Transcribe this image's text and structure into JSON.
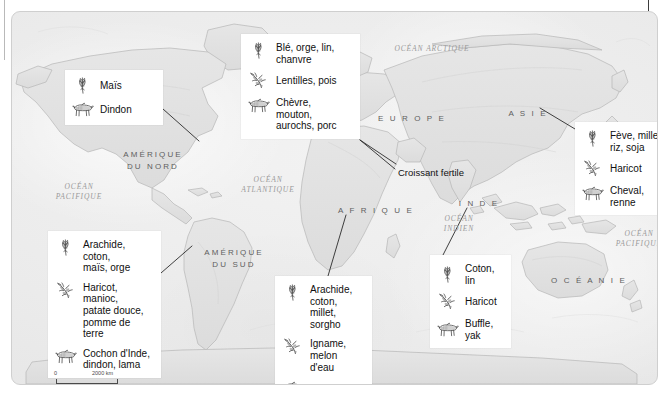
{
  "map": {
    "title_visible": false,
    "scale": {
      "zero_label": "0",
      "max_label": "2000 km"
    },
    "continent_labels": [
      {
        "name": "amerique-du-nord",
        "text": "AMÉRIQUE\nDU NORD",
        "x": 95,
        "y": 137,
        "w": 92
      },
      {
        "name": "amerique-du-sud",
        "text": "AMÉRIQUE\nDU SUD",
        "x": 178,
        "y": 235,
        "w": 88
      },
      {
        "name": "europe",
        "text": "E U R O P E",
        "x": 357,
        "y": 101,
        "w": 86
      },
      {
        "name": "afrique",
        "text": "A F R I Q U E",
        "x": 318,
        "y": 193,
        "w": 92
      },
      {
        "name": "asie",
        "text": "A S I E",
        "x": 488,
        "y": 96,
        "w": 56
      },
      {
        "name": "inde",
        "text": "I N D E",
        "x": 443,
        "y": 186,
        "w": 48
      },
      {
        "name": "oceanie",
        "text": "O C É A N I E",
        "x": 531,
        "y": 263,
        "w": 92
      }
    ],
    "ocean_labels": [
      {
        "name": "ocean-arctique",
        "text": "OCÉAN ARCTIQUE",
        "x": 374,
        "y": 32,
        "w": 92
      },
      {
        "name": "ocean-pacifique-ouest",
        "text": "OCÉAN\nPACIFIQUE",
        "x": 36,
        "y": 170,
        "w": 62
      },
      {
        "name": "ocean-atlantique",
        "text": "OCÉAN\nATLANTIQUE",
        "x": 222,
        "y": 163,
        "w": 68
      },
      {
        "name": "ocean-indien",
        "text": "OCÉAN\nINDIEN",
        "x": 418,
        "y": 202,
        "w": 58
      },
      {
        "name": "ocean-pacifique-est",
        "text": "OCÉAN\nPACIFIQUE",
        "x": 596,
        "y": 217,
        "w": 62
      }
    ],
    "point_labels": [
      {
        "name": "croissant-fertile",
        "text": "Croissant fertile",
        "x": 386,
        "y": 155
      }
    ],
    "callouts": [
      {
        "name": "callout-amerique-du-nord",
        "x": 53,
        "y": 58,
        "w": 98,
        "anchor_x": 151,
        "anchor_y": 97,
        "target_x": 187,
        "target_y": 129,
        "rows": [
          {
            "icon": "grain-icon",
            "text": "Maïs",
            "single": true
          },
          {
            "icon": "animal-icon",
            "text": "Dindon",
            "single": true
          }
        ]
      },
      {
        "name": "callout-croissant-fertile",
        "x": 229,
        "y": 22,
        "w": 119,
        "anchor_x": 348,
        "anchor_y": 128,
        "target_x": 383,
        "target_y": 157,
        "rows": [
          {
            "icon": "grain-icon",
            "text": "Blé, orge, lin,\nchanvre",
            "single": false
          },
          {
            "icon": "legume-icon",
            "text": "Lentilles, pois",
            "single": true
          },
          {
            "icon": "animal-icon",
            "text": "Chèvre,\nmouton,\naurochs, porc",
            "single": false
          }
        ]
      },
      {
        "name": "callout-asie",
        "x": 563,
        "y": 110,
        "w": 100,
        "anchor_x": 563,
        "anchor_y": 117,
        "target_x": 528,
        "target_y": 96,
        "rows": [
          {
            "icon": "grain-icon",
            "text": "Fève, millet,\nriz, soja",
            "single": false
          },
          {
            "icon": "legume-icon",
            "text": "Haricot",
            "single": true
          },
          {
            "icon": "animal-icon",
            "text": "Cheval,\nrenne",
            "single": false
          }
        ]
      },
      {
        "name": "callout-amerique-du-sud",
        "x": 36,
        "y": 219,
        "w": 113,
        "anchor_x": 149,
        "anchor_y": 261,
        "target_x": 180,
        "target_y": 234,
        "rows": [
          {
            "icon": "grain-icon",
            "text": "Arachide, coton,\nmaïs, orge",
            "single": false
          },
          {
            "icon": "legume-icon",
            "text": "Haricot, manioc,\npatate douce,\npomme de terre",
            "single": false
          },
          {
            "icon": "animal-icon",
            "text": "Cochon d'Inde,\ndindon, lama",
            "single": false
          }
        ]
      },
      {
        "name": "callout-afrique",
        "x": 263,
        "y": 264,
        "w": 97,
        "anchor_x": 316,
        "anchor_y": 264,
        "target_x": 334,
        "target_y": 203,
        "rows": [
          {
            "icon": "grain-icon",
            "text": "Arachide,\ncoton, millet,\nsorgho",
            "single": false
          },
          {
            "icon": "legume-icon",
            "text": "Igname,\nmelon d'eau",
            "single": false
          },
          {
            "icon": "animal-icon",
            "text": "Aurochs",
            "single": true
          }
        ]
      },
      {
        "name": "callout-inde",
        "x": 418,
        "y": 243,
        "w": 81,
        "anchor_x": 431,
        "anchor_y": 243,
        "target_x": 455,
        "target_y": 196,
        "rows": [
          {
            "icon": "grain-icon",
            "text": "Coton, lin",
            "single": true
          },
          {
            "icon": "legume-icon",
            "text": "Haricot",
            "single": true
          },
          {
            "icon": "animal-icon",
            "text": "Buffle, yak",
            "single": true
          }
        ]
      }
    ],
    "colors": {
      "land": "#e0e0e0",
      "ocean": "#ededed",
      "coastline": "#b5b5b5",
      "callout_background": "#ffffff",
      "text": "#101010",
      "geo_text": "#5e5e5e",
      "ocean_text": "#9a9a9a",
      "connector": "#2b2b2b",
      "frame": "#cfcfcf"
    }
  }
}
